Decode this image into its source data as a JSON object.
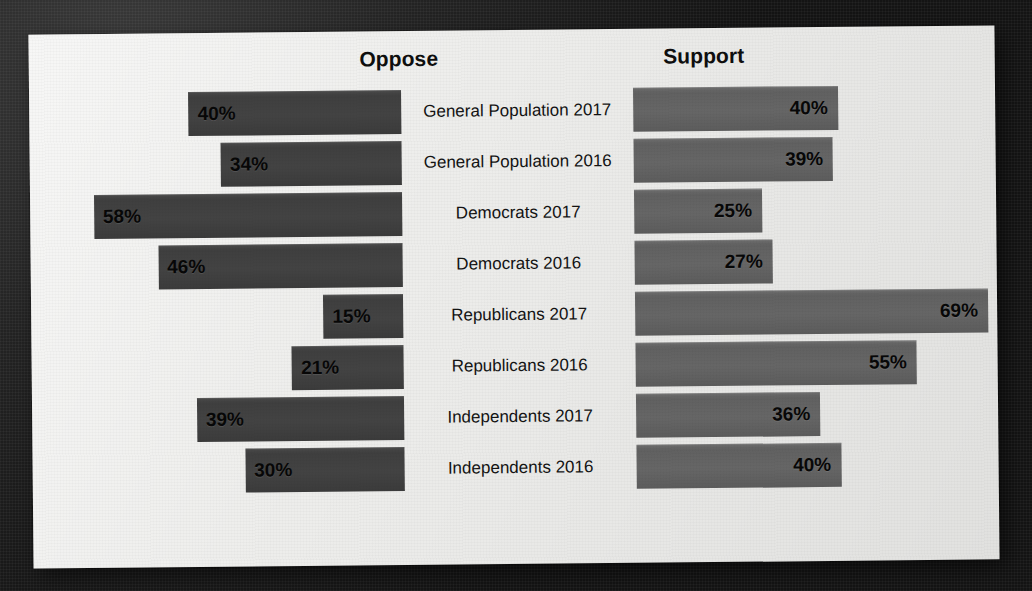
{
  "chart_data": {
    "type": "bar",
    "title": "",
    "subtitle": "",
    "orientation": "horizontal-diverging",
    "xlabel": "",
    "ylabel": "",
    "grid": false,
    "legend_position": "top",
    "axis_max_percent": 70,
    "left_header": "Oppose",
    "right_header": "Support",
    "categories": [
      "General Population 2017",
      "General Population 2016",
      "Democrats 2017",
      "Democrats 2016",
      "Republicans 2017",
      "Republicans 2016",
      "Independents 2017",
      "Independents 2016"
    ],
    "series": [
      {
        "name": "Oppose",
        "values": [
          40,
          34,
          58,
          46,
          15,
          21,
          39,
          30
        ],
        "labels": [
          "40%",
          "34%",
          "58%",
          "46%",
          "15%",
          "21%",
          "39%",
          "30%"
        ],
        "color": "#434343"
      },
      {
        "name": "Support",
        "values": [
          40,
          39,
          25,
          27,
          69,
          55,
          36,
          40
        ],
        "labels": [
          "40%",
          "39%",
          "25%",
          "27%",
          "69%",
          "55%",
          "36%",
          "40%"
        ],
        "color": "#666666"
      }
    ]
  },
  "colors": {
    "panel_background": "#ededeb",
    "backdrop": "#181818",
    "oppose_bar": "#434343",
    "support_bar": "#666666",
    "text": "#131313"
  }
}
